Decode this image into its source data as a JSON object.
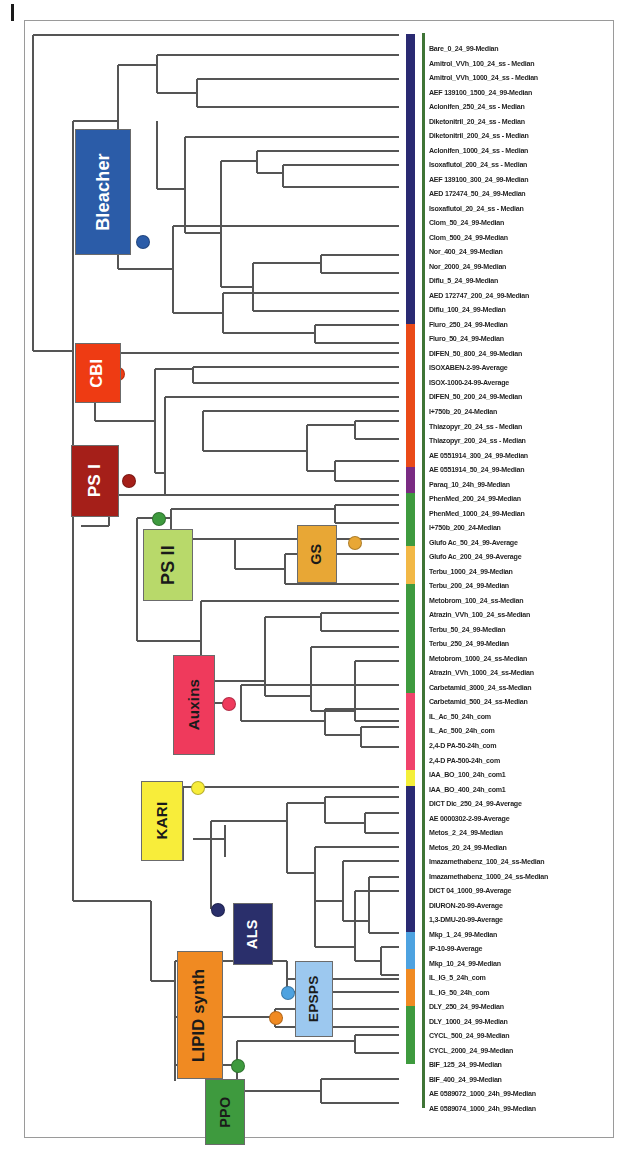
{
  "figure": {
    "type": "dendrogram",
    "orientation": "left-to-right, tips on right"
  },
  "groups": [
    {
      "name": "Bleacher",
      "label": "Bleacher",
      "color": "#2b5ca8",
      "text_color": "#ffffff",
      "x": 50,
      "y": 108,
      "w": 56,
      "h": 126
    },
    {
      "name": "CBI",
      "label": "CBI",
      "color": "#ee3b13",
      "text_color": "#ffffff",
      "x": 50,
      "y": 322,
      "w": 46,
      "h": 60
    },
    {
      "name": "PS I",
      "label": "PS I",
      "color": "#a51f19",
      "text_color": "#ffffff",
      "x": 46,
      "y": 424,
      "w": 48,
      "h": 72
    },
    {
      "name": "PS II",
      "label": "PS II",
      "color": "#b8d96a",
      "text_color": "#1a1a1a",
      "x": 118,
      "y": 508,
      "w": 50,
      "h": 72
    },
    {
      "name": "GS",
      "label": "GS",
      "color": "#e8a735",
      "text_color": "#1a1a1a",
      "x": 272,
      "y": 504,
      "w": 40,
      "h": 58
    },
    {
      "name": "Auxins",
      "label": "Auxins",
      "color": "#ef3a5c",
      "text_color": "#1a1a1a",
      "x": 148,
      "y": 634,
      "w": 42,
      "h": 100
    },
    {
      "name": "KARI",
      "label": "KARI",
      "color": "#f8ed3a",
      "text_color": "#1a1a1a",
      "x": 116,
      "y": 760,
      "w": 42,
      "h": 80
    },
    {
      "name": "ALS",
      "label": "ALS",
      "color": "#2a2f6b",
      "text_color": "#ffffff",
      "x": 208,
      "y": 882,
      "w": 40,
      "h": 62
    },
    {
      "name": "LIPID synth",
      "label": "LIPID synth",
      "color": "#f08a22",
      "text_color": "#1a1a1a",
      "x": 152,
      "y": 930,
      "w": 46,
      "h": 128
    },
    {
      "name": "EPSPS",
      "label": "EPSPS",
      "color": "#9cc8ef",
      "text_color": "#1a1a1a",
      "x": 270,
      "y": 940,
      "w": 38,
      "h": 76
    },
    {
      "name": "PPO",
      "label": "PPO",
      "color": "#3e9a3e",
      "text_color": "#1a1a1a",
      "x": 180,
      "y": 1058,
      "w": 40,
      "h": 66
    }
  ],
  "strip_segments": [
    {
      "name": "bleacher",
      "color": "#2a2a72",
      "start": 0.0,
      "end": 0.282
    },
    {
      "name": "cbi",
      "color": "#ea4a18",
      "start": 0.282,
      "end": 0.42
    },
    {
      "name": "psi",
      "color": "#7a2b82",
      "start": 0.42,
      "end": 0.446
    },
    {
      "name": "psii-a",
      "color": "#3e9a3e",
      "start": 0.446,
      "end": 0.497
    },
    {
      "name": "gs",
      "color": "#f2b846",
      "start": 0.497,
      "end": 0.534
    },
    {
      "name": "psii-b",
      "color": "#3e9a3e",
      "start": 0.534,
      "end": 0.64
    },
    {
      "name": "auxins",
      "color": "#f0436b",
      "start": 0.64,
      "end": 0.715
    },
    {
      "name": "kari",
      "color": "#f4ef3a",
      "start": 0.715,
      "end": 0.73
    },
    {
      "name": "als",
      "color": "#2a2a72",
      "start": 0.73,
      "end": 0.872
    },
    {
      "name": "epsps",
      "color": "#4da2e0",
      "start": 0.872,
      "end": 0.908
    },
    {
      "name": "lipid",
      "color": "#f08a22",
      "start": 0.908,
      "end": 0.944
    },
    {
      "name": "ppo",
      "color": "#3e9a3e",
      "start": 0.944,
      "end": 1.0
    }
  ],
  "node_markers": [
    {
      "name": "bleacher-node",
      "color": "#2b5ca8",
      "x": 117,
      "y": 220
    },
    {
      "name": "cbi-node",
      "color": "#ee3b13",
      "x": 92,
      "y": 352
    },
    {
      "name": "psi-node",
      "color": "#a51f19",
      "x": 103,
      "y": 459
    },
    {
      "name": "psii-node",
      "color": "#3e9a3e",
      "x": 133,
      "y": 497
    },
    {
      "name": "gs-node",
      "color": "#e8a735",
      "x": 329,
      "y": 521
    },
    {
      "name": "auxins-node",
      "color": "#ef3a5c",
      "x": 203,
      "y": 682
    },
    {
      "name": "kari-node",
      "color": "#f8ed3a",
      "x": 172,
      "y": 766
    },
    {
      "name": "als-node",
      "color": "#2a2f6b",
      "x": 192,
      "y": 888
    },
    {
      "name": "epsps-node",
      "color": "#4da2e0",
      "x": 262,
      "y": 971
    },
    {
      "name": "lipid-node",
      "color": "#f08a22",
      "x": 250,
      "y": 996
    },
    {
      "name": "ppo-node",
      "color": "#3e9a3e",
      "x": 212,
      "y": 1044
    }
  ],
  "tips": [
    "Bare_0_24_99-Median",
    "Amitrol_VVh_100_24_ss - Median",
    "Amitrol_VVh_1000_24_ss - Median",
    "AEF 139100_1500_24_99-Median",
    "Aclonifen_250_24_ss - Median",
    "Diketonitril_20_24_ss - Median",
    "Diketonitril_200_24_ss - Median",
    "Aclonifen_1000_24_ss - Median",
    "Isoxaflutol_200_24_ss - Median",
    "AEF 139100_300_24_99-Median",
    "AED 172474_50_24_99-Median",
    "Isoxaflutol_20_24_ss - Median",
    "Clom_50_24_99-Median",
    "Clom_500_24_99-Median",
    "Nor_400_24_99-Median",
    "Nor_2000_24_99-Median",
    "Diflu_5_24_99-Median",
    "AED 172747_200_24_99-Median",
    "Diflu_100_24_99-Median",
    "Fluro_250_24_99-Median",
    "Fluro_50_24_99-Median",
    "DIFEN_50_800_24_99-Median",
    "ISOXABEN-2-99-Average",
    "ISOX-1000-24-99-Average",
    "DIFEN_50_200_24_99-Median",
    "I+750b_20_24-Median",
    "Thiazopyr_20_24_ss - Median",
    "Thiazopyr_200_24_ss - Median",
    "AE 0551914_300_24_99-Median",
    "AE 0551914_50_24_99-Median",
    "Paraq_10_24h_99-Median",
    "PhenMed_200_24_99-Median",
    "PhenMed_1000_24_99-Median",
    "I+750b_200_24-Median",
    "Glufo Ac_50_24_99-Average",
    "Glufo Ac_200_24_99-Average",
    "Terbu_1000_24_99-Median",
    "Terbu_200_24_99-Median",
    "Metobrom_100_24_ss-Median",
    "Atrazin_VVh_100_24_ss-Median",
    "Terbu_50_24_99-Median",
    "Terbu_250_24_99-Median",
    "Metobrom_1000_24_ss-Median",
    "Atrazin_VVh_1000_24_ss-Median",
    "Carbetamid_3000_24_ss-Median",
    "Carbetamid_500_24_ss-Median",
    "IL_Ac_50_24h_com",
    "IL_Ac_500_24h_com",
    "2,4-D PA-50-24h_com",
    "2,4-D PA-500-24h_com",
    "IAA_BO_100_24h_com1",
    "IAA_BO_400_24h_com1",
    "DICT Dic_250_24_99-Average",
    "AE 0000302-2-99-Average",
    "Metos_2_24_99-Median",
    "Metos_20_24_99-Median",
    "Imazamethabenz_100_24_ss-Median",
    "Imazamethabenz_1000_24_ss-Median",
    "DICT 04_1000_99-Average",
    "DIURON-20-99-Average",
    "1,3-DMU-20-99-Average",
    "Mkp_1_24_99-Median",
    "IP-10-99-Average",
    "Mkp_10_24_99-Median",
    "IL_IG_5_24h_com",
    "IL_IG_50_24h_com",
    "DLY_250_24_99-Median",
    "DLY_1000_24_99-Median",
    "CYCL_500_24_99-Median",
    "CYCL_2000_24_99-Median",
    "BIF_125_24_99-Median",
    "BIF_400_24_99-Median",
    "AE 0589072_1000_24h_99-Median",
    "AE 0589074_1000_24h_99-Median"
  ]
}
